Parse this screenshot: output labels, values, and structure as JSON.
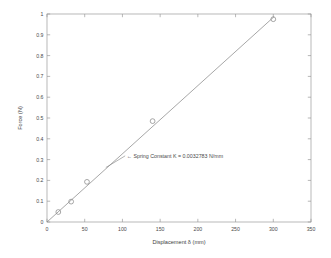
{
  "chart_data": {
    "type": "scatter",
    "title": "",
    "xlabel": "Displacement δ (mm)",
    "ylabel": "Force (N)",
    "xlim": [
      0,
      350
    ],
    "ylim": [
      0,
      1
    ],
    "xticks": [
      0,
      50,
      100,
      150,
      200,
      250,
      300,
      350
    ],
    "xtick_labels": [
      "0",
      "50",
      "100",
      "150",
      "200",
      "250",
      "300",
      "350"
    ],
    "yticks": [
      0,
      0.1,
      0.2,
      0.3,
      0.4,
      0.5,
      0.6,
      0.7,
      0.8,
      0.9,
      1
    ],
    "ytick_labels": [
      "0",
      "0.1",
      "0.2",
      "0.3",
      "0.4",
      "0.5",
      "0.6",
      "0.7",
      "0.8",
      "0.9",
      "1"
    ],
    "grid": false,
    "legend": null,
    "series": [
      {
        "name": "Measured data",
        "type": "scatter",
        "marker": "circle-open",
        "color": "#8a8a8a",
        "x": [
          15,
          32,
          53,
          140,
          300
        ],
        "y": [
          0.048,
          0.098,
          0.193,
          0.485,
          0.975
        ]
      },
      {
        "name": "Linear fit",
        "type": "line",
        "color": "#8a8a8a",
        "x": [
          0,
          301
        ],
        "y": [
          0.0,
          0.9868
        ]
      }
    ],
    "annotations": [
      {
        "text": "← Spring Constant K = 0.0032783 N/mm",
        "x": 97,
        "y": 0.318,
        "arrow_to_x": 78,
        "arrow_to_y": 0.262
      }
    ]
  },
  "axis": {
    "x_title": "Displacement δ (mm)",
    "y_title": "Force (N)"
  },
  "annotation": {
    "spring_constant_label": "← Spring Constant K = 0.0032783 N/mm"
  },
  "colors": {
    "background": "#ffffff",
    "axis": "#9a9a9a",
    "data": "#8a8a8a",
    "text": "#4a4a4a"
  }
}
